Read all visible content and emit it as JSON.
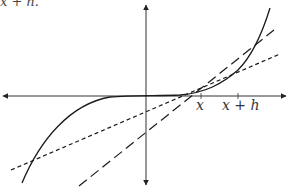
{
  "caption_fragment": "x + h.",
  "labels": {
    "x_tick": "x",
    "xh_tick": "x + h"
  },
  "colors": {
    "stroke": "#1a1a1a",
    "axis": "#333333",
    "background": "#ffffff"
  },
  "diagram": {
    "type": "function-plot-with-secant-and-tangent",
    "axes": {
      "origin_px": [
        146,
        96
      ],
      "x_range_px": [
        2,
        287
      ],
      "y_range_px": [
        5,
        185
      ]
    },
    "curve": {
      "style": "solid",
      "description": "cubic-like curve f",
      "from_px": [
        22,
        183
      ],
      "to_px": [
        270,
        8
      ]
    },
    "tangent_line": {
      "style": "short-dashed",
      "from_px": [
        11,
        170
      ],
      "to_px": [
        280,
        54
      ]
    },
    "secant_line": {
      "style": "long-dashed",
      "from_px": [
        79,
        186
      ],
      "to_px": [
        274,
        30
      ]
    },
    "ticks": [
      {
        "label": "x",
        "x_px": 201
      },
      {
        "label": "x + h",
        "x_px": 238
      }
    ]
  }
}
